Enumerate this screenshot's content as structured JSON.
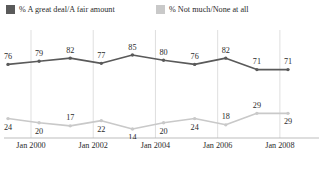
{
  "legend": {
    "items": [
      {
        "label": "% A great deal/A fair amount",
        "color": "#5a5a5a",
        "name": "legend-series-great-deal"
      },
      {
        "label": "% Not much/None at all",
        "color": "#c9c9c9",
        "name": "legend-series-not-much"
      }
    ]
  },
  "chart_data": {
    "type": "line",
    "title": "",
    "subtitle": "",
    "xlabel": "",
    "ylabel": "",
    "ylim": [
      0,
      100
    ],
    "grid": true,
    "legend_position": "top-left",
    "x": [
      "Jan 2000",
      "Jan 2001",
      "Jan 2002",
      "Jan 2003",
      "Jan 2004",
      "Jan 2005",
      "Jan 2006",
      "Jan 2007",
      "Jan 2008",
      "Jan 2009"
    ],
    "tick_labels": [
      "Jan 2000",
      "Jan 2002",
      "Jan 2004",
      "Jan 2006",
      "Jan 2008"
    ],
    "tick_indices": [
      0,
      2,
      4,
      6,
      8
    ],
    "series": [
      {
        "name": "% A great deal/A fair amount",
        "color": "#5a5a5a",
        "values": [
          76,
          79,
          82,
          77,
          85,
          80,
          76,
          82,
          71,
          71
        ],
        "label_positions": [
          "above",
          "above",
          "above",
          "above",
          "above",
          "above",
          "above",
          "above",
          "above",
          "above"
        ]
      },
      {
        "name": "% Not much/None at all",
        "color": "#c9c9c9",
        "values": [
          24,
          20,
          17,
          22,
          14,
          20,
          24,
          18,
          29,
          29
        ],
        "label_positions": [
          "below",
          "below",
          "above",
          "below",
          "below",
          "below",
          "below",
          "above",
          "above",
          "below"
        ]
      }
    ]
  }
}
